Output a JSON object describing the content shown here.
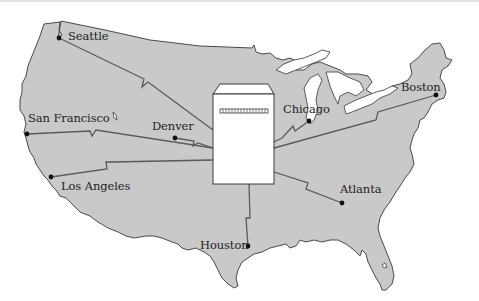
{
  "diagram": {
    "type": "network-map",
    "region": "contiguous United States",
    "colors": {
      "land": "#c9c9c9",
      "border": "#4a4a4a",
      "link": "#5a5a5a",
      "city_dot": "#111111",
      "server_fill": "#ffffff",
      "background": "#ffffff"
    },
    "central_node": {
      "name": "central-server",
      "shape": "computer cabinet with slot"
    },
    "cities": [
      {
        "id": "seattle",
        "label": "Seattle"
      },
      {
        "id": "san-francisco",
        "label": "San Francisco"
      },
      {
        "id": "denver",
        "label": "Denver"
      },
      {
        "id": "los-angeles",
        "label": "Los Angeles"
      },
      {
        "id": "houston",
        "label": "Houston"
      },
      {
        "id": "atlanta",
        "label": "Atlanta"
      },
      {
        "id": "chicago",
        "label": "Chicago"
      },
      {
        "id": "boston",
        "label": "Boston"
      }
    ],
    "links": [
      {
        "from": "central-server",
        "to": "seattle"
      },
      {
        "from": "central-server",
        "to": "san-francisco"
      },
      {
        "from": "central-server",
        "to": "denver"
      },
      {
        "from": "central-server",
        "to": "los-angeles"
      },
      {
        "from": "central-server",
        "to": "houston"
      },
      {
        "from": "central-server",
        "to": "atlanta"
      },
      {
        "from": "central-server",
        "to": "chicago"
      },
      {
        "from": "central-server",
        "to": "boston"
      }
    ]
  }
}
